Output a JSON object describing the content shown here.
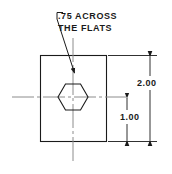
{
  "drawing": {
    "title": "hexagonal-hole-plate-dimension-drawing",
    "colors": {
      "outline": "#1a1a1a",
      "centerline": "#8c8c8c",
      "background": "#ffffff",
      "text": "#1a1a1a"
    },
    "notes": {
      "hex_note_line_1": ".75 ACROSS",
      "hex_note_line_2": "THE FLATS"
    },
    "dimensions": {
      "overall_height": "2.00",
      "center_height": "1.00"
    },
    "geometry": {
      "plate": {
        "shape": "rectangle",
        "left": 40,
        "top": 55,
        "width": 66,
        "height": 86
      },
      "hexagon": {
        "shape": "hexagon-flat-top",
        "center_x": 73,
        "center_y": 97,
        "across_flats": 26,
        "across_corners": 30
      },
      "centerlines": {
        "horizontal_y": 97,
        "horizontal_x1": 12,
        "horizontal_x2": 126,
        "vertical_x": 73,
        "vertical_y1": 38,
        "vertical_y2": 163
      },
      "leader": {
        "hook_x": 57,
        "hook_y": 13,
        "bend_x": 62,
        "bend_y": 13,
        "tip_x": 74,
        "tip_y": 72
      },
      "dim_overall": {
        "line_x": 150,
        "y_top": 55,
        "y_bottom": 141
      },
      "dim_center": {
        "line_x": 127,
        "y_top": 97,
        "y_bottom": 141
      },
      "extension_top": {
        "x1": 108,
        "x2": 157,
        "y": 55
      },
      "extension_bottom": {
        "x1": 108,
        "x2": 157,
        "y": 141
      }
    }
  }
}
